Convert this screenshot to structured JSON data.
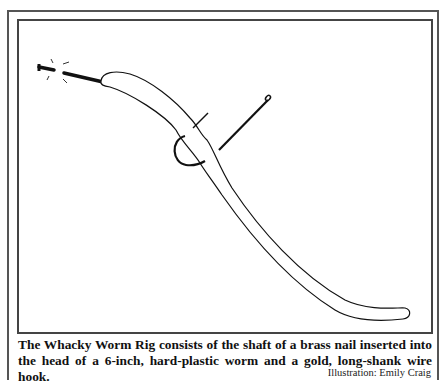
{
  "illustration": {
    "subject": "Whacky Worm Rig diagram",
    "parts": [
      "brass-nail",
      "plastic-worm",
      "long-shank-wire-hook"
    ]
  },
  "caption": {
    "text": "The Whacky Worm Rig consists of the shaft of a brass nail inserted into the head of a 6-inch, hard-plastic worm and a gold, long-shank wire hook.",
    "credit": "Illustration: Emily Craig"
  }
}
